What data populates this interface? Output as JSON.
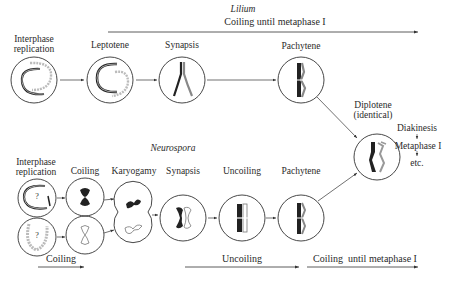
{
  "lilium": {
    "organism": "Lilium",
    "process_label": "Coiling until metaphase I",
    "stages": [
      {
        "label": "Interphase replication",
        "line1": "Interphase",
        "line2": "replication"
      },
      {
        "label": "Leptotene"
      },
      {
        "label": "Synapsis"
      },
      {
        "label": "Pachytene"
      }
    ]
  },
  "shared": {
    "diplotene_line1": "Diplotene",
    "diplotene_line2": "(identical)",
    "diakinesis": "Diakinesis",
    "metaphase": "Metaphase I",
    "etc": "etc."
  },
  "neurospora": {
    "organism": "Neurospora",
    "stages": [
      {
        "label": "Interphase replication",
        "line1": "Interphase",
        "line2": "replication"
      },
      {
        "label": "Coiling"
      },
      {
        "label": "Karyogamy"
      },
      {
        "label": "Synapsis"
      },
      {
        "label": "Uncoiling"
      },
      {
        "label": "Pachytene"
      }
    ],
    "process_labels": {
      "coiling": "Coiling",
      "uncoiling": "Uncoiling",
      "coiling_until": "Coiling  until metaphase I"
    },
    "unknown_marker": "?"
  },
  "colors": {
    "ink": "#2a2a2a",
    "light_strand": "#b5b5b5",
    "background": "#ffffff"
  }
}
